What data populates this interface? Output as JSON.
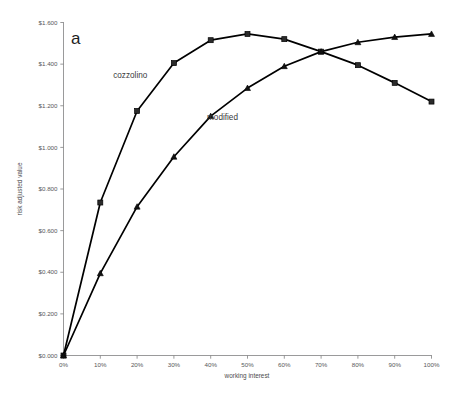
{
  "figure": {
    "panel_letter": "a",
    "background_color": "#ffffff",
    "line_color": "#000000"
  },
  "chart_data": {
    "type": "line",
    "title": "",
    "xlabel": "working interest",
    "ylabel": "risk adjusted value",
    "categories": [
      "0%",
      "10%",
      "20%",
      "30%",
      "40%",
      "50%",
      "60%",
      "70%",
      "80%",
      "90%",
      "100%"
    ],
    "x": [
      0,
      10,
      20,
      30,
      40,
      50,
      60,
      70,
      80,
      90,
      100
    ],
    "xlim": [
      0,
      100
    ],
    "ylim": [
      0.0,
      1.6
    ],
    "grid": false,
    "legend_position": "inline-annotation",
    "xtick_labels": [
      "0%",
      "10%",
      "20%",
      "30%",
      "40%",
      "50%",
      "60%",
      "70%",
      "80%",
      "90%",
      "100%"
    ],
    "ytick_values": [
      0.0,
      0.2,
      0.4,
      0.6,
      0.8,
      1.0,
      1.2,
      1.4,
      1.6
    ],
    "ytick_labels": [
      "$0.000",
      "$0.200",
      "$0.400",
      "$0.600",
      "$0.800",
      "$1.000",
      "$1.200",
      "$1.400",
      "$1.600"
    ],
    "series": [
      {
        "name": "cozzolino",
        "marker": "square",
        "values": [
          0.0,
          0.735,
          1.175,
          1.405,
          1.515,
          1.545,
          1.52,
          1.46,
          1.395,
          1.31,
          1.22
        ]
      },
      {
        "name": "modified",
        "marker": "triangle",
        "values": [
          0.0,
          0.395,
          0.715,
          0.955,
          1.15,
          1.285,
          1.39,
          1.46,
          1.505,
          1.53,
          1.545
        ]
      }
    ],
    "annotations": [
      {
        "text": "cozzolino",
        "x": 13.5,
        "y": 1.335
      },
      {
        "text": "modified",
        "x": 39.0,
        "y": 1.13
      },
      {
        "text": "a",
        "x": 3.5,
        "y": 1.575
      }
    ]
  }
}
